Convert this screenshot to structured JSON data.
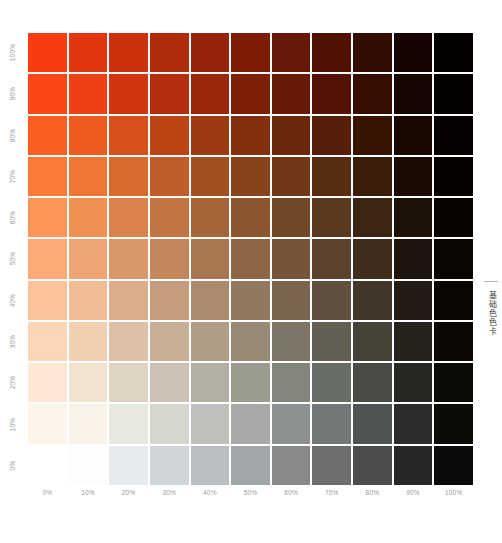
{
  "chart_data": {
    "type": "heatmap",
    "title": "",
    "subtitle": "",
    "xlabel": "",
    "ylabel": "",
    "grid": true,
    "legend_position": "none",
    "x_label_name": "black-ink-percent",
    "y_label_name": "color-ink-percent",
    "categories": [
      "0%",
      "10%",
      "20%",
      "30%",
      "40%",
      "50%",
      "60%",
      "70%",
      "80%",
      "90%",
      "100%"
    ],
    "y_categories": [
      "100%",
      "90%",
      "80%",
      "70%",
      "60%",
      "50%",
      "40%",
      "30%",
      "20%",
      "10%",
      "0%"
    ],
    "x_values": [
      0,
      10,
      20,
      30,
      40,
      50,
      60,
      70,
      80,
      90,
      100
    ],
    "y_values": [
      100,
      90,
      80,
      70,
      60,
      50,
      40,
      30,
      20,
      10,
      0
    ],
    "cell_colors": [
      [
        "#f93c10",
        "#e2360f",
        "#cc300d",
        "#b02a0c",
        "#97230a",
        "#7d1d08",
        "#671806",
        "#4f1205",
        "#330c03",
        "#150401",
        "#040000"
      ],
      [
        "#fa4715",
        "#f03f12",
        "#d13510",
        "#b52d0d",
        "#9a260b",
        "#7e1f09",
        "#691a07",
        "#521305",
        "#350d03",
        "#170501",
        "#050000"
      ],
      [
        "#fb5f1f",
        "#ef5a1d",
        "#d74f1a",
        "#bb4415",
        "#9e3a12",
        "#83300f",
        "#6c280c",
        "#551f09",
        "#381405",
        "#190702",
        "#060000"
      ],
      [
        "#fb7b36",
        "#f07634",
        "#d96a2e",
        "#c05d28",
        "#a35021",
        "#88431b",
        "#703816",
        "#582c11",
        "#3a1d0a",
        "#1b0b04",
        "#070200"
      ],
      [
        "#fc9557",
        "#f09053",
        "#d9834b",
        "#c27442",
        "#a66539",
        "#8b562f",
        "#724827",
        "#5a391e",
        "#3c2613",
        "#1d1108",
        "#080400"
      ],
      [
        "#fcab77",
        "#efa573",
        "#da9768",
        "#c3875d",
        "#a87751",
        "#8e6645",
        "#75543a",
        "#5d432d",
        "#3f2d1d",
        "#1f150e",
        "#090502"
      ],
      [
        "#fcc39b",
        "#f0bc96",
        "#dbad8a",
        "#c59c7c",
        "#ab8a6e",
        "#92785f",
        "#79644f",
        "#60503f",
        "#423729",
        "#221c15",
        "#0a0703"
      ],
      [
        "#fdd6b7",
        "#f1d0b2",
        "#ddc1a6",
        "#c8af97",
        "#af9d88",
        "#968a77",
        "#7d7566",
        "#645f53",
        "#464237",
        "#25221c",
        "#0b0805"
      ],
      [
        "#fde8d5",
        "#f2e3d1",
        "#dfd4c4",
        "#cbc2b4",
        "#b3afa2",
        "#9b9b90",
        "#81857c",
        "#686d66",
        "#494c45",
        "#272824",
        "#0c0a07"
      ],
      [
        "#fef5ea",
        "#f8f2e8",
        "#e9e8df",
        "#d6d6cf",
        "#bfc0bb",
        "#a7a9a6",
        "#8d9090",
        "#737778",
        "#505353",
        "#2c2c2c",
        "#0d0b08"
      ],
      [
        "#ffffff",
        "#fdfdfd",
        "#e7eaec",
        "#d2d5d7",
        "#bcbfc1",
        "#a3a6a8",
        "#88898b",
        "#6d6e70",
        "#4b4c4d",
        "#272727",
        "#0b0b0b"
      ]
    ]
  },
  "y_axis": {
    "ticks": [
      "100%",
      "90%",
      "80%",
      "70%",
      "60%",
      "50%",
      "40%",
      "30%",
      "20%",
      "10%",
      "0%"
    ]
  },
  "x_axis": {
    "ticks": [
      "0%",
      "10%",
      "20%",
      "30%",
      "40%",
      "50%",
      "60%",
      "70%",
      "80%",
      "90%",
      "100%"
    ]
  },
  "side_caption": {
    "text": "基础色色卡"
  },
  "colors": {
    "background": "#ffffff",
    "tick_text": "#9a9a9a",
    "caption_text": "#3b3b3b",
    "rule": "#b5b5b5"
  }
}
